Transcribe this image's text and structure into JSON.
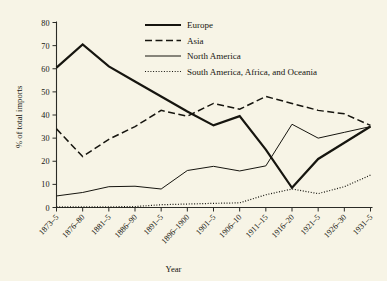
{
  "chart_data": {
    "type": "line",
    "title": "",
    "xlabel": "Year",
    "ylabel": "% of total imports",
    "ylim": [
      0,
      80
    ],
    "yticks": [
      0,
      10,
      20,
      30,
      40,
      50,
      60,
      70,
      80
    ],
    "grid": false,
    "legend_position": "top-center",
    "categories": [
      "1873–5",
      "1876–80",
      "1881–5",
      "1886–90",
      "1891–5",
      "1896–1900",
      "1901–5",
      "1906–10",
      "1911–15",
      "1916–20",
      "1921–5",
      "1926–30",
      "1931–5"
    ],
    "series": [
      {
        "name": "Europe",
        "style": "solid-thick",
        "color": "#16150f",
        "values": [
          60.5,
          70.5,
          61.0,
          54.5,
          48.0,
          41.5,
          35.5,
          39.5,
          25.0,
          8.5,
          21.0,
          28.0,
          35.0
        ]
      },
      {
        "name": "Asia",
        "style": "dashed",
        "color": "#16150f",
        "values": [
          34.0,
          22.0,
          29.5,
          35.0,
          42.0,
          39.5,
          45.0,
          42.5,
          48.0,
          45.0,
          42.0,
          40.5,
          35.5
        ]
      },
      {
        "name": "North America",
        "style": "solid-thin",
        "color": "#16150f",
        "values": [
          5.0,
          6.5,
          9.0,
          9.2,
          8.0,
          16.0,
          17.8,
          15.8,
          18.0,
          36.0,
          30.0,
          32.5,
          35.0
        ]
      },
      {
        "name": "South America, Africa, and Oceania",
        "style": "dotted",
        "color": "#16150f",
        "values": [
          0.3,
          0.3,
          0.3,
          0.4,
          1.2,
          1.5,
          1.8,
          2.0,
          5.5,
          8.0,
          6.0,
          9.0,
          14.0
        ]
      }
    ]
  },
  "legend": {
    "items": [
      {
        "label": "Europe"
      },
      {
        "label": "Asia"
      },
      {
        "label": "North America"
      },
      {
        "label": "South America, Africa, and Oceania"
      }
    ]
  },
  "axes": {
    "y_title": "% of total imports",
    "x_title": "Year",
    "y_tick_labels": [
      "0",
      "10",
      "20",
      "30",
      "40",
      "50",
      "60",
      "70",
      "80"
    ],
    "x_tick_labels": [
      "1873–5",
      "1876–80",
      "1881–5",
      "1886–90",
      "1891–5",
      "1896–1900",
      "1901–5",
      "1906–10",
      "1911–15",
      "1916–20",
      "1921–5",
      "1926–30",
      "1931–5"
    ]
  },
  "colors": {
    "background": "#f7f4e6",
    "ink": "#16150f"
  }
}
